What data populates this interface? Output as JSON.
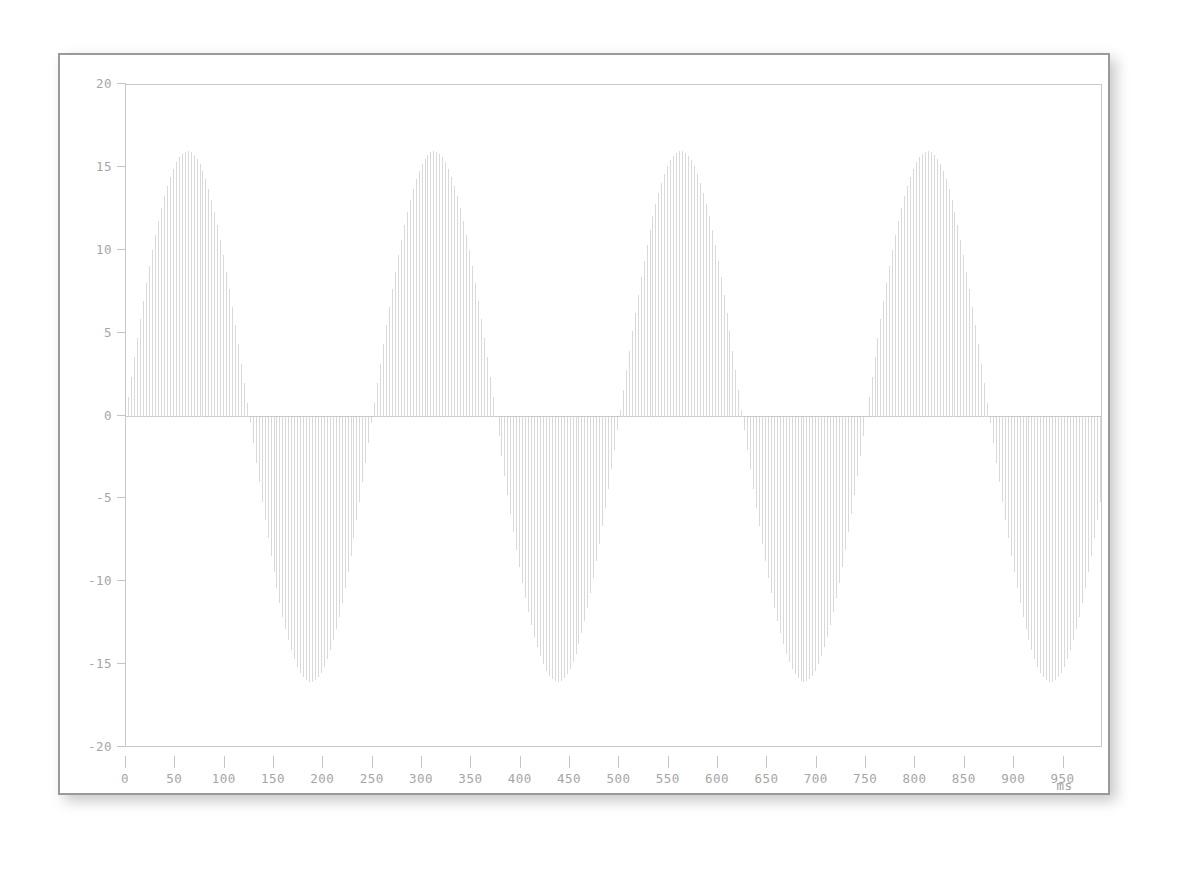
{
  "figure": {
    "title": "",
    "background_color": "#ffffff",
    "frame_color": "#c9c9c9",
    "window_border_color": "#9a9a9a",
    "tick_label_color": "#a6a6a6",
    "stem_color": "#d9d9d9"
  },
  "axes": {
    "y_ticks": [
      "20",
      "15",
      "10",
      "5",
      "0",
      "-5",
      "-10",
      "-15",
      "-20"
    ],
    "x_ticks": [
      "0",
      "50",
      "100",
      "150",
      "200",
      "250",
      "300",
      "350",
      "400",
      "450",
      "500",
      "550",
      "600",
      "650",
      "700",
      "750",
      "800",
      "850",
      "900",
      "950"
    ],
    "x_unit_label": "ms",
    "y_unit_label": ""
  },
  "chart_data": {
    "type": "line",
    "render_style": "impulse-stems",
    "title": "",
    "xlabel": "ms",
    "ylabel": "",
    "xlim": [
      0,
      990
    ],
    "ylim": [
      -20,
      20
    ],
    "x_tick_values": [
      0,
      50,
      100,
      150,
      200,
      250,
      300,
      350,
      400,
      450,
      500,
      550,
      600,
      650,
      700,
      750,
      800,
      850,
      900,
      950
    ],
    "y_tick_values": [
      20,
      15,
      10,
      5,
      0,
      -5,
      -10,
      -15,
      -20
    ],
    "grid": false,
    "legend": null,
    "series": [
      {
        "name": "signal",
        "waveform": "sine",
        "amplitude": 16,
        "period_ms": 250,
        "frequency_hz": 4,
        "phase_deg": 0,
        "offset": 0,
        "sample_interval_ms": 3,
        "color": "#d9d9d9",
        "stem_width_px": 1,
        "description": "Sampled 4 Hz sine, peak amplitude 16, drawn as thin vertical impulse lines from the zero baseline.",
        "peaks": [
          {
            "x": 63,
            "y": 16
          },
          {
            "x": 313,
            "y": 16
          },
          {
            "x": 563,
            "y": 16
          },
          {
            "x": 813,
            "y": 16
          }
        ],
        "troughs": [
          {
            "x": 188,
            "y": -16
          },
          {
            "x": 438,
            "y": -16
          },
          {
            "x": 688,
            "y": -16
          },
          {
            "x": 938,
            "y": -16
          }
        ],
        "zero_crossings": [
          0,
          125,
          250,
          375,
          500,
          625,
          750,
          875
        ]
      }
    ]
  }
}
